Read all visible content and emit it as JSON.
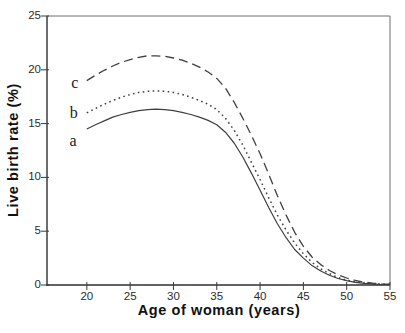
{
  "figure": {
    "background": "#ffffff",
    "line_color": "#3f3f3f",
    "border_color": "#444444",
    "text_color": "#1a1a1a"
  },
  "chart_data": {
    "type": "line",
    "title": "",
    "xlabel": "Age of woman (years)",
    "ylabel": "Live birth rate (%)",
    "xlim": [
      15.4,
      55
    ],
    "ylim": [
      0,
      25
    ],
    "x_ticks": [
      20,
      25,
      30,
      35,
      40,
      45,
      50,
      55
    ],
    "y_ticks": [
      0,
      5,
      10,
      15,
      20,
      25
    ],
    "grid": false,
    "legend_position": "inline-curve-labels",
    "x": [
      20,
      21,
      22,
      23,
      24,
      25,
      26,
      27,
      28,
      29,
      30,
      31,
      32,
      33,
      34,
      35,
      36,
      37,
      38,
      39,
      40,
      41,
      42,
      43,
      44,
      45,
      46,
      47,
      48,
      49,
      50,
      51,
      52,
      53,
      54,
      55
    ],
    "series": [
      {
        "name": "a",
        "label": "a",
        "style": "solid",
        "values": [
          14.5,
          14.9,
          15.25,
          15.6,
          15.85,
          16.05,
          16.2,
          16.3,
          16.35,
          16.3,
          16.2,
          16.05,
          15.85,
          15.6,
          15.3,
          14.9,
          14.2,
          13.2,
          11.9,
          10.4,
          8.8,
          7.2,
          5.7,
          4.4,
          3.3,
          2.5,
          1.8,
          1.3,
          0.9,
          0.6,
          0.4,
          0.25,
          0.15,
          0.1,
          0.05,
          0.05
        ],
        "label_at": {
          "age": 18.4,
          "value": 13.4
        }
      },
      {
        "name": "b",
        "label": "b",
        "style": "dotted",
        "values": [
          16.0,
          16.4,
          16.8,
          17.15,
          17.45,
          17.7,
          17.9,
          18.0,
          18.05,
          18.0,
          17.9,
          17.7,
          17.45,
          17.15,
          16.8,
          16.3,
          15.5,
          14.4,
          13.0,
          11.4,
          9.8,
          8.1,
          6.5,
          5.1,
          3.9,
          2.9,
          2.1,
          1.5,
          1.05,
          0.7,
          0.45,
          0.3,
          0.2,
          0.12,
          0.08,
          0.05
        ],
        "label_at": {
          "age": 18.5,
          "value": 16.0
        }
      },
      {
        "name": "c",
        "label": "c",
        "style": "dashed",
        "values": [
          19.0,
          19.5,
          19.95,
          20.35,
          20.7,
          20.95,
          21.15,
          21.3,
          21.3,
          21.25,
          21.1,
          20.9,
          20.6,
          20.25,
          19.8,
          19.2,
          18.3,
          17.0,
          15.5,
          13.9,
          12.2,
          10.3,
          8.3,
          6.5,
          4.9,
          3.6,
          2.6,
          1.9,
          1.35,
          0.95,
          0.65,
          0.42,
          0.27,
          0.17,
          0.1,
          0.07
        ],
        "label_at": {
          "age": 18.6,
          "value": 18.8
        }
      }
    ]
  }
}
